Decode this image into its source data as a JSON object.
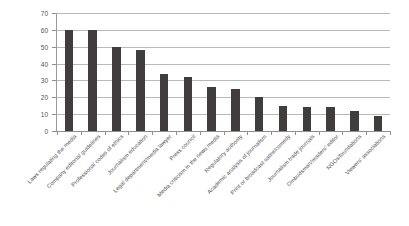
{
  "chart_data": {
    "type": "bar",
    "title": "",
    "xlabel": "",
    "ylabel": "",
    "ylim": [
      0,
      70
    ],
    "yticks": [
      0,
      10,
      20,
      30,
      40,
      50,
      60,
      70
    ],
    "grid": true,
    "legend": false,
    "bar_color": "#413d3c",
    "categories": [
      "Laws regulating the media",
      "Company editorial guidelines",
      "Professional codes of ethics",
      "Journalism education",
      "Legal department/media lawyer",
      "Press council",
      "Media criticism in the news media",
      "Regulatory authority",
      "Academic analysis of journalism",
      "Print or broadcast satire/comedy",
      "Journalism trade journals",
      "Ombudsman/readers' editor",
      "NGOs/foundations",
      "Viewers' associations"
    ],
    "values": [
      60,
      60,
      50,
      48,
      34,
      32,
      26,
      25,
      20,
      15,
      14,
      14,
      12,
      9
    ]
  }
}
